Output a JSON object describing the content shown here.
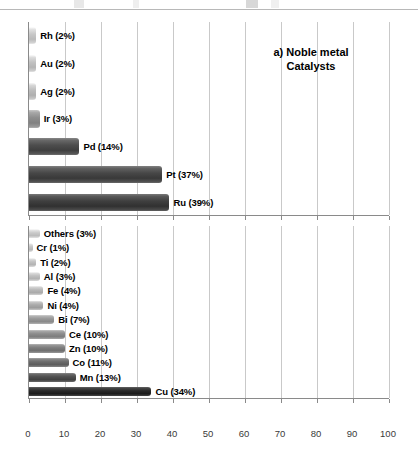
{
  "figure": {
    "background": "#ffffff",
    "axis_color": "#8a8a8a",
    "grid_color": "#c9c9c9",
    "label_color": "#000000"
  },
  "chart_data": [
    {
      "type": "bar",
      "orientation": "horizontal",
      "title": "a) Noble metal\nCatalysts",
      "panel_letter": "a)",
      "xlabel": "",
      "ylabel": "",
      "xlim": [
        0,
        100
      ],
      "xticks": [
        0,
        10,
        20,
        30,
        40,
        50,
        60,
        70,
        80,
        90,
        100
      ],
      "xtick_labels_visible": false,
      "grid": true,
      "grid_axis": "x",
      "legend": false,
      "categories": [
        "Rh",
        "Au",
        "Ag",
        "Ir",
        "Pd",
        "Pt",
        "Ru"
      ],
      "values": [
        2,
        2,
        2,
        3,
        14,
        37,
        39
      ],
      "bars": [
        {
          "label": "Rh (2%)",
          "category": "Rh",
          "value": 2,
          "color": "#c8c8c8"
        },
        {
          "label": "Au (2%)",
          "category": "Au",
          "value": 2,
          "color": "#c2c2c2"
        },
        {
          "label": "Ag (2%)",
          "category": "Ag",
          "value": 2,
          "color": "#bdbdbd"
        },
        {
          "label": "Ir (3%)",
          "category": "Ir",
          "value": 3,
          "color": "#8e8e8e"
        },
        {
          "label": "Pd (14%)",
          "category": "Pd",
          "value": 14,
          "color": "#4d4d4d"
        },
        {
          "label": "Pt (37%)",
          "category": "Pt",
          "value": 37,
          "color": "#474747"
        },
        {
          "label": "Ru (39%)",
          "category": "Ru",
          "value": 39,
          "color": "#3f3f3f"
        }
      ]
    },
    {
      "type": "bar",
      "orientation": "horizontal",
      "title": "b) Transition metal\nCatalysts",
      "panel_letter": "b)",
      "xlabel": "",
      "ylabel": "",
      "xlim": [
        0,
        100
      ],
      "xticks": [
        0,
        10,
        20,
        30,
        40,
        50,
        60,
        70,
        80,
        90,
        100
      ],
      "xtick_labels": [
        "0",
        "10",
        "20",
        "30",
        "40",
        "50",
        "60",
        "70",
        "80",
        "90",
        "100"
      ],
      "xtick_labels_visible": true,
      "grid": true,
      "grid_axis": "x",
      "legend": false,
      "categories": [
        "Others",
        "Cr",
        "Ti",
        "Al",
        "Fe",
        "Ni",
        "Bi",
        "Ce",
        "Zn",
        "Co",
        "Mn",
        "Cu"
      ],
      "values": [
        3,
        1,
        2,
        3,
        4,
        4,
        7,
        10,
        10,
        11,
        13,
        34
      ],
      "bars": [
        {
          "label": "Others (3%)",
          "category": "Others",
          "value": 3,
          "color": "#cacaca"
        },
        {
          "label": "Cr (1%)",
          "category": "Cr",
          "value": 1,
          "color": "#c6c6c6"
        },
        {
          "label": "Ti (2%)",
          "category": "Ti",
          "value": 2,
          "color": "#c2c2c2"
        },
        {
          "label": "Al (3%)",
          "category": "Al",
          "value": 3,
          "color": "#c0c0c0"
        },
        {
          "label": "Fe (4%)",
          "category": "Fe",
          "value": 4,
          "color": "#b8b8b8"
        },
        {
          "label": "Ni (4%)",
          "category": "Ni",
          "value": 4,
          "color": "#ababab"
        },
        {
          "label": "Bi (7%)",
          "category": "Bi",
          "value": 7,
          "color": "#989898"
        },
        {
          "label": "Ce (10%)",
          "category": "Ce",
          "value": 10,
          "color": "#8c8c8c"
        },
        {
          "label": "Zn (10%)",
          "category": "Zn",
          "value": 10,
          "color": "#7d7d7d"
        },
        {
          "label": "Co (11%)",
          "category": "Co",
          "value": 11,
          "color": "#6b6b6b"
        },
        {
          "label": "Mn (13%)",
          "category": "Mn",
          "value": 13,
          "color": "#4f4f4f"
        },
        {
          "label": "Cu (34%)",
          "category": "Cu",
          "value": 34,
          "color": "#2b2b2b"
        }
      ]
    }
  ]
}
